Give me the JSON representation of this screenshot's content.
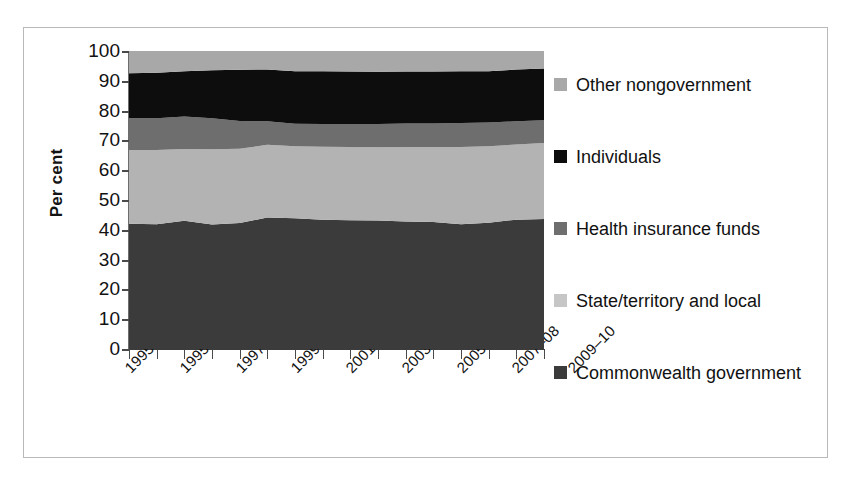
{
  "chart_data": {
    "type": "area",
    "stacked": true,
    "title": "",
    "subtitle": "",
    "xlabel": "",
    "ylabel": "Per cent",
    "ylim": [
      0,
      100
    ],
    "ytick_values": [
      0,
      10,
      20,
      30,
      40,
      50,
      60,
      70,
      80,
      90,
      100
    ],
    "grid": false,
    "legend_position": "right",
    "x": [
      "1995–96",
      "1995–96",
      "1996–97",
      "1997–98",
      "1998–99",
      "1999–00",
      "2000–01",
      "2001–02",
      "2002–03",
      "2003–04",
      "2004–05",
      "2005–06",
      "2006–07",
      "2007–08",
      "2008–09",
      "2009–10"
    ],
    "xtick_labels": [
      "1995–96",
      "1995–96",
      "1997–98",
      "1999–00",
      "2001–02",
      "2003–04",
      "2005–06",
      "2007–08",
      "2009–10"
    ],
    "xtick_count": 16,
    "series": [
      {
        "name": "Commonwealth government",
        "color": "#3b3b3b",
        "values": [
          42.0,
          41.9,
          43.0,
          41.8,
          42.3,
          44.1,
          43.9,
          43.4,
          43.2,
          43.1,
          42.8,
          42.6,
          41.9,
          42.4,
          43.4,
          43.6
        ]
      },
      {
        "name": "State/territory and local",
        "color": "#b3b3b3",
        "values": [
          24.8,
          24.9,
          24.1,
          25.2,
          24.9,
          24.4,
          24.1,
          24.5,
          24.6,
          24.6,
          25.0,
          25.2,
          25.9,
          25.6,
          25.2,
          25.5
        ]
      },
      {
        "name": "Health insurance funds",
        "color": "#6e6e6e",
        "values": [
          10.6,
          10.6,
          10.9,
          10.4,
          9.3,
          7.9,
          7.6,
          7.6,
          7.7,
          7.8,
          7.9,
          7.9,
          8.0,
          8.0,
          7.8,
          7.7
        ]
      },
      {
        "name": "Individuals",
        "color": "#0d0d0d",
        "values": [
          15.1,
          15.3,
          15.2,
          16.1,
          17.2,
          17.4,
          17.6,
          17.7,
          17.6,
          17.5,
          17.4,
          17.4,
          17.4,
          17.2,
          17.4,
          17.3
        ]
      },
      {
        "name": "Other nongovernment",
        "color": "#a8a8a8",
        "values": [
          7.5,
          7.3,
          6.8,
          6.5,
          6.3,
          6.2,
          6.8,
          6.8,
          6.9,
          7.0,
          6.9,
          6.9,
          6.8,
          6.8,
          6.2,
          5.9
        ]
      }
    ]
  },
  "axis": {
    "y_title": "Per cent",
    "y_ticks": [
      "100",
      "90",
      "80",
      "70",
      "60",
      "50",
      "40",
      "30",
      "20",
      "10",
      "0"
    ]
  },
  "legend": {
    "items": [
      {
        "label": "Other nongovernment",
        "color": "#a8a8a8"
      },
      {
        "label": "Individuals",
        "color": "#0d0d0d"
      },
      {
        "label": "Health insurance funds",
        "color": "#6e6e6e"
      },
      {
        "label": "State/territory and local",
        "color": "#c6c6c6"
      },
      {
        "label": "Commonwealth government",
        "color": "#3b3b3b"
      }
    ]
  }
}
